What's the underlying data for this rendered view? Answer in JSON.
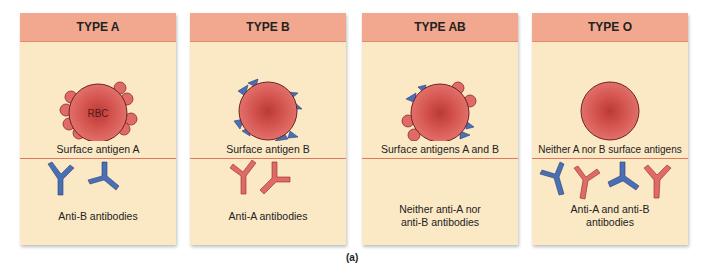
{
  "figure_label": "(a)",
  "colors": {
    "header": "#f2a88e",
    "panel": "#fbe9c6",
    "rbc": "#d9534f",
    "antigen_a": "#e06a66",
    "antigen_b": "#4a6fb5",
    "anti_a_antibody": "#d9534f",
    "anti_b_antibody": "#4a6fb5"
  },
  "panels": [
    {
      "title": "TYPE A",
      "cell_label": "RBC",
      "antigen_caption": "Surface antigen A",
      "antibody_caption": "Anti-B antibodies",
      "antigens": [
        "A"
      ],
      "antibodies": [
        "anti-B",
        "anti-B"
      ]
    },
    {
      "title": "TYPE B",
      "antigen_caption": "Surface antigen B",
      "antibody_caption": "Anti-A antibodies",
      "antigens": [
        "B"
      ],
      "antibodies": [
        "anti-A",
        "anti-A"
      ]
    },
    {
      "title": "TYPE AB",
      "antigen_caption": "Surface antigens A and B",
      "antibody_caption_line1": "Neither anti-A nor",
      "antibody_caption_line2": "anti-B antibodies",
      "antigens": [
        "A",
        "B"
      ],
      "antibodies": []
    },
    {
      "title": "TYPE O",
      "antigen_caption": "Neither A nor B surface antigens",
      "antibody_caption_line1": "Anti-A and anti-B",
      "antibody_caption_line2": "antibodies",
      "antigens": [],
      "antibodies": [
        "anti-B",
        "anti-A",
        "anti-B",
        "anti-A"
      ]
    }
  ]
}
